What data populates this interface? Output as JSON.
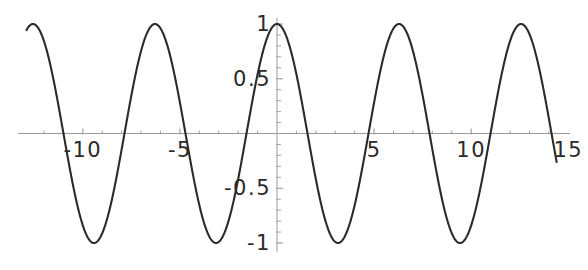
{
  "figure": {
    "kind": "function-plot",
    "background_color": "#ffffff",
    "curve_color": "#2b2b2b",
    "axis_color": "#9a9a9a",
    "label_color": "#2b2b2b"
  },
  "chart_data": {
    "type": "line",
    "title": "",
    "xlabel": "",
    "ylabel": "",
    "expression": "cos(x)",
    "grid": false,
    "legend": false,
    "legend_position": "none",
    "xlim": [
      -12.9,
      14.4
    ],
    "ylim": [
      -1,
      1
    ],
    "x_ticks": [
      -10,
      -5,
      5,
      10,
      15
    ],
    "x_tick_labels": [
      "-10",
      "-5",
      "5",
      "10",
      "15"
    ],
    "y_ticks": [
      -1,
      -0.5,
      0.5,
      1
    ],
    "y_tick_labels": [
      "-1",
      "-0.5",
      "0.5",
      "1"
    ],
    "x_minor_tick_step": 1,
    "y_minor_tick_step": 0.1,
    "series": [
      {
        "name": "cos(x)",
        "amplitude": 1,
        "period": 6.2832,
        "phase": 0,
        "x": [
          -12.9,
          -12.6,
          -12.3,
          -12.0,
          -11.7,
          -11.4,
          -11.1,
          -10.8,
          -10.5,
          -10.2,
          -9.9,
          -9.6,
          -9.3,
          -9.0,
          -8.7,
          -8.4,
          -8.1,
          -7.8,
          -7.5,
          -7.2,
          -6.9,
          -6.6,
          -6.3,
          -6.0,
          -5.7,
          -5.4,
          -5.1,
          -4.8,
          -4.5,
          -4.2,
          -3.9,
          -3.6,
          -3.3,
          -3.0,
          -2.7,
          -2.4,
          -2.1,
          -1.8,
          -1.5,
          -1.2,
          -0.9,
          -0.6,
          -0.3,
          0.0,
          0.3,
          0.6,
          0.9,
          1.2,
          1.5,
          1.8,
          2.1,
          2.4,
          2.7,
          3.0,
          3.3,
          3.6,
          3.9,
          4.2,
          4.5,
          4.8,
          5.1,
          5.4,
          5.7,
          6.0,
          6.3,
          6.6,
          6.9,
          7.2,
          7.5,
          7.8,
          8.1,
          8.4,
          8.7,
          9.0,
          9.3,
          9.6,
          9.9,
          10.2,
          10.5,
          10.8,
          11.1,
          11.4,
          11.7,
          12.0,
          12.3,
          12.6,
          12.9,
          13.2,
          13.5,
          13.8,
          14.1,
          14.4
        ],
        "y": [
          0.97,
          0.99,
          0.93,
          0.84,
          0.7,
          0.52,
          0.32,
          0.11,
          -0.11,
          -0.32,
          -0.52,
          -0.7,
          -0.84,
          -0.91,
          -0.99,
          -0.52,
          -0.32,
          0.03,
          0.35,
          0.61,
          0.83,
          0.95,
          1.0,
          0.96,
          0.83,
          0.63,
          0.38,
          0.09,
          -0.21,
          -0.49,
          -0.73,
          -0.9,
          -0.99,
          -0.99,
          -0.9,
          -0.74,
          -0.5,
          -0.23,
          0.07,
          0.36,
          0.62,
          0.83,
          0.96,
          1.0,
          0.96,
          0.83,
          0.62,
          0.36,
          0.07,
          -0.23,
          -0.5,
          -0.74,
          -0.9,
          -0.99,
          -0.99,
          -0.9,
          -0.73,
          -0.49,
          -0.21,
          0.09,
          0.38,
          0.63,
          0.83,
          0.96,
          1.0,
          0.95,
          0.83,
          0.61,
          0.35,
          0.03,
          -0.29,
          -0.52,
          -0.76,
          -0.91,
          -0.99,
          -0.99,
          -0.91,
          -0.76,
          -0.52,
          -0.29,
          0.01,
          0.32,
          0.59,
          0.84,
          0.97,
          1.0,
          0.95,
          0.83,
          0.62,
          0.36,
          0.07,
          -0.23
        ]
      }
    ]
  },
  "axis_labels": {
    "x": [
      {
        "text": "-10",
        "value": -10
      },
      {
        "text": "-5",
        "value": -5
      },
      {
        "text": "5",
        "value": 5
      },
      {
        "text": "10",
        "value": 10
      },
      {
        "text": "15",
        "value": 15
      }
    ],
    "y": [
      {
        "text": "1",
        "value": 1
      },
      {
        "text": "0.5",
        "value": 0.5
      },
      {
        "text": "-0.5",
        "value": -0.5
      },
      {
        "text": "-1",
        "value": -1
      }
    ]
  }
}
